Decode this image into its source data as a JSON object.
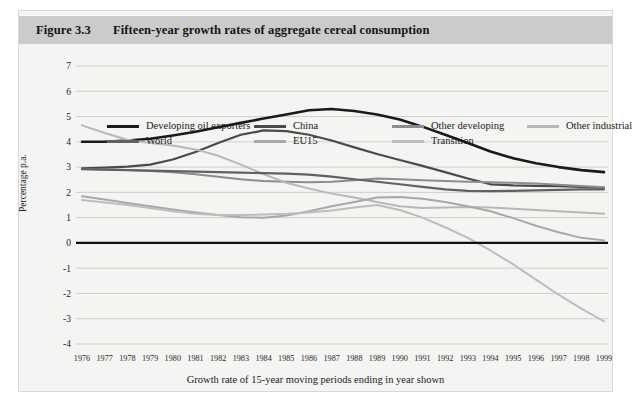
{
  "figure": {
    "number_label": "Figure 3.3",
    "title": "Fifteen-year growth rates of aggregate cereal consumption"
  },
  "chart_data": {
    "type": "line",
    "title": "Fifteen-year growth rates of aggregate cereal consumption",
    "xlabel": "Growth rate of 15-year moving periods ending in year shown",
    "ylabel": "Percentage p.a.",
    "xlim": [
      1976,
      1999
    ],
    "ylim": [
      -4,
      7
    ],
    "ytick_values": [
      7,
      6,
      5,
      4,
      3,
      2,
      1,
      0,
      -1,
      -2,
      -3,
      -4
    ],
    "ytick_labels": [
      "7",
      "6",
      "5",
      "4",
      "3",
      "2",
      "1",
      "0",
      "-1",
      "-2",
      "-3",
      "-4"
    ],
    "grid": true,
    "zero_line": true,
    "legend_position": "top",
    "categories": [
      1976,
      1977,
      1978,
      1979,
      1980,
      1981,
      1982,
      1983,
      1984,
      1985,
      1986,
      1987,
      1988,
      1989,
      1990,
      1991,
      1992,
      1993,
      1994,
      1995,
      1996,
      1997,
      1998,
      1999
    ],
    "xtick_labels": [
      "1976",
      "1977",
      "1978",
      "1979",
      "1980",
      "1981",
      "1982",
      "1983",
      "1984",
      "1985",
      "1986",
      "1987",
      "1988",
      "1989",
      "1990",
      "1991",
      "1992",
      "1993",
      "1994",
      "1995",
      "1996",
      "1997",
      "1998",
      "1999"
    ],
    "series": [
      {
        "name": "Developing oil exporters",
        "color": "#1a1a1a",
        "width": 2.6,
        "values": [
          4.0,
          4.0,
          4.05,
          4.12,
          4.25,
          4.4,
          4.58,
          4.75,
          4.92,
          5.08,
          5.25,
          5.3,
          5.22,
          5.08,
          4.88,
          4.6,
          4.28,
          3.95,
          3.62,
          3.35,
          3.15,
          3.0,
          2.88,
          2.8
        ]
      },
      {
        "name": "China",
        "color": "#4a4a4a",
        "width": 2.2,
        "values": [
          2.95,
          2.98,
          3.02,
          3.1,
          3.3,
          3.6,
          3.95,
          4.28,
          4.45,
          4.42,
          4.28,
          4.05,
          3.78,
          3.52,
          3.28,
          3.05,
          2.8,
          2.55,
          2.32,
          2.28,
          2.26,
          2.25,
          2.22,
          2.18
        ]
      },
      {
        "name": "Other developing",
        "color": "#8c8c8c",
        "width": 2.0,
        "values": [
          2.92,
          2.9,
          2.88,
          2.85,
          2.8,
          2.72,
          2.62,
          2.52,
          2.45,
          2.42,
          2.4,
          2.42,
          2.48,
          2.55,
          2.52,
          2.48,
          2.45,
          2.42,
          2.4,
          2.38,
          2.35,
          2.3,
          2.25,
          2.2
        ]
      },
      {
        "name": "Other industrial",
        "color": "#b8b8b8",
        "width": 2.0,
        "values": [
          4.65,
          4.35,
          4.08,
          3.95,
          3.85,
          3.7,
          3.45,
          3.1,
          2.72,
          2.38,
          2.15,
          1.95,
          1.8,
          1.62,
          1.45,
          1.38,
          1.4,
          1.42,
          1.4,
          1.35,
          1.3,
          1.25,
          1.2,
          1.15
        ]
      },
      {
        "name": "World",
        "color": "#616161",
        "width": 2.2,
        "values": [
          2.92,
          2.9,
          2.88,
          2.86,
          2.84,
          2.82,
          2.8,
          2.78,
          2.76,
          2.74,
          2.7,
          2.62,
          2.52,
          2.42,
          2.32,
          2.22,
          2.12,
          2.06,
          2.05,
          2.06,
          2.08,
          2.1,
          2.12,
          2.12
        ]
      },
      {
        "name": "EU15",
        "color": "#a8a8a8",
        "width": 2.0,
        "values": [
          1.85,
          1.72,
          1.58,
          1.45,
          1.32,
          1.2,
          1.1,
          1.02,
          1.0,
          1.08,
          1.25,
          1.45,
          1.62,
          1.8,
          1.82,
          1.75,
          1.62,
          1.45,
          1.25,
          0.98,
          0.68,
          0.42,
          0.2,
          0.1
        ]
      },
      {
        "name": "Transition",
        "color": "#bdbdbd",
        "width": 2.0,
        "values": [
          1.7,
          1.6,
          1.5,
          1.38,
          1.25,
          1.15,
          1.1,
          1.1,
          1.12,
          1.15,
          1.2,
          1.28,
          1.4,
          1.5,
          1.3,
          1.0,
          0.62,
          0.2,
          -0.3,
          -0.85,
          -1.45,
          -2.05,
          -2.6,
          -3.1
        ]
      }
    ],
    "legend_entries": [
      {
        "label": "Developing oil exporters",
        "color": "#1a1a1a",
        "row": 0,
        "col": 0
      },
      {
        "label": "China",
        "color": "#4a4a4a",
        "row": 0,
        "col": 1
      },
      {
        "label": "Other developing",
        "color": "#8c8c8c",
        "row": 0,
        "col": 2
      },
      {
        "label": "Other industrial",
        "color": "#b8b8b8",
        "row": 0,
        "col": 3
      },
      {
        "label": "World",
        "color": "#616161",
        "row": 1,
        "col": 0
      },
      {
        "label": "EU15",
        "color": "#a8a8a8",
        "row": 1,
        "col": 1
      },
      {
        "label": "Transition",
        "color": "#bdbdbd",
        "row": 1,
        "col": 2
      }
    ]
  }
}
